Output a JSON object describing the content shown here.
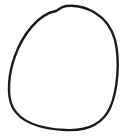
{
  "drawing": {
    "subject": "hand-drawn oval outline",
    "stroke_color": "#1a1a1a",
    "background_color": "#ffffff",
    "stroke_width": 2.4
  }
}
